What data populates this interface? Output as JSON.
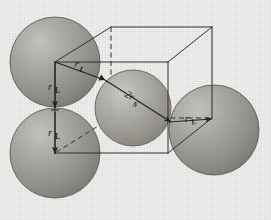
{
  "figure": {
    "background_color": "#f2f0ee",
    "sphere_fill": "#9a9894",
    "sphere_stroke": "#5d5b57",
    "line_color": "#2b2b2b",
    "label_color": "#1a1a1a"
  },
  "labels": {
    "radius_large_top_left_vertical": "r",
    "radius_large_top_left_vertical_sub": "L",
    "radius_large_bottom_left_vertical": "r",
    "radius_large_bottom_left_vertical_sub": "L",
    "radius_large_upper_diagonal": "r",
    "radius_large_upper_diagonal_sub": "L",
    "radius_large_lower_diagonal": "r",
    "radius_large_lower_diagonal_sub": "L",
    "diameter_small_center": "2r",
    "diameter_small_center_sub": "S"
  },
  "spheres": [
    {
      "name": "large-sphere-top-left",
      "cx": 55,
      "cy": 62,
      "r": 45,
      "size": "large"
    },
    {
      "name": "large-sphere-bottom-left",
      "cx": 55,
      "cy": 153,
      "r": 45,
      "size": "large"
    },
    {
      "name": "large-sphere-center",
      "cx": 133,
      "cy": 108,
      "r": 38,
      "size": "small"
    },
    {
      "name": "large-sphere-right",
      "cx": 214,
      "cy": 130,
      "r": 45,
      "size": "large"
    }
  ],
  "cube": {
    "front_top_left": [
      55,
      62
    ],
    "front_top_right": [
      168,
      62
    ],
    "front_bottom_left": [
      55,
      153
    ],
    "front_bottom_right": [
      168,
      153
    ],
    "back_top_left": [
      111,
      27
    ],
    "back_top_right": [
      212,
      27
    ],
    "back_bottom_left": [
      111,
      118
    ],
    "back_bottom_right": [
      212,
      118
    ],
    "hidden_edges": [
      "back_top_left-back_bottom_left",
      "back_bottom_left-back_bottom_right",
      "back_bottom_left-front_bottom_left"
    ]
  },
  "arrows": [
    {
      "name": "arrow-rL-vertical-upper",
      "from": [
        55,
        62
      ],
      "to": [
        55,
        107
      ],
      "label": "rL"
    },
    {
      "name": "arrow-rL-vertical-lower",
      "from": [
        55,
        110
      ],
      "to": [
        55,
        153
      ],
      "label": "rL"
    },
    {
      "name": "arrow-rL-diagonal-upper",
      "from": [
        55,
        62
      ],
      "to": [
        104,
        80
      ],
      "label": "rL"
    },
    {
      "name": "arrow-2rS-body-diagonal",
      "from": [
        104,
        80
      ],
      "to": [
        170,
        122
      ],
      "label": "2rS"
    },
    {
      "name": "arrow-rL-diagonal-lower",
      "from": [
        170,
        122
      ],
      "to": [
        212,
        118
      ],
      "label": "rL"
    }
  ]
}
